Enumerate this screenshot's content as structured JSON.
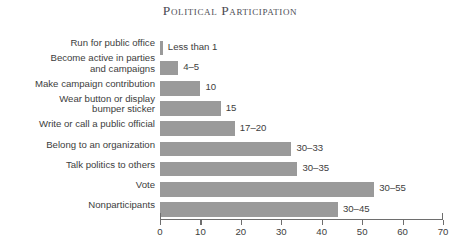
{
  "chart_data": {
    "type": "bar",
    "orientation": "horizontal",
    "title": "Political Participation",
    "xlabel": "",
    "ylabel": "",
    "xlim": [
      0,
      70
    ],
    "xticks": [
      0,
      10,
      20,
      30,
      40,
      50,
      60,
      70
    ],
    "grid": false,
    "legend": null,
    "bar_color": "#9a9a9a",
    "axis_color": "#6e6e6e",
    "categories": [
      "Run for public office",
      "Become active in parties\nand campaigns",
      "Make campaign contribution",
      "Wear button or display\nbumper sticker",
      "Write or call a public official",
      "Belong to an organization",
      "Talk politics to others",
      "Vote",
      "Nonparticipants"
    ],
    "values": [
      0.7,
      4.5,
      10,
      15,
      18.5,
      32.5,
      34,
      53,
      44
    ],
    "data_labels": [
      "Less than 1",
      "4–5",
      "10",
      "15",
      "17–20",
      "30–33",
      "30–35",
      "30–55",
      "30–45"
    ]
  }
}
